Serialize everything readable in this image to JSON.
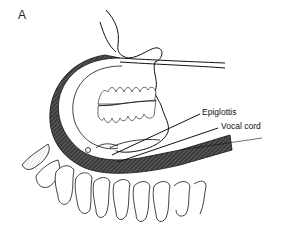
{
  "figure": {
    "panel_letter": "A",
    "labels": {
      "epiglottis": "Epiglottis",
      "vocal_cord": "Vocal cord"
    },
    "colors": {
      "line": "#111111",
      "tube_fill": "#2a2a2a",
      "background": "#ffffff"
    }
  }
}
